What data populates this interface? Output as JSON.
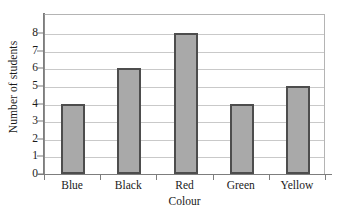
{
  "chart_data": {
    "type": "bar",
    "title": "",
    "categories": [
      "Blue",
      "Black",
      "Red",
      "Green",
      "Yellow"
    ],
    "values": [
      4,
      6,
      8,
      4,
      5
    ],
    "series": [
      {
        "name": "Number of students",
        "values": [
          4,
          6,
          8,
          4,
          5
        ]
      }
    ],
    "xlabel": "Colour",
    "ylabel": "Number of students",
    "ylim": [
      0,
      8
    ],
    "y_ticks": [
      0,
      1,
      2,
      3,
      4,
      5,
      6,
      7,
      8
    ],
    "y_tick_labels": [
      "0",
      "1",
      "2",
      "3",
      "4",
      "5",
      "6",
      "7",
      "8"
    ],
    "grid": true,
    "grid_axis": "y",
    "legend": false,
    "legend_position": "none",
    "bar_fill_color": "#a9a9a9",
    "bar_edge_color": "#4d4d4d",
    "gridline_color": "#c9c9c9",
    "axis_color": "#7d7d7d",
    "background_color": "#ffffff",
    "text_color": "#1a1a1a"
  }
}
